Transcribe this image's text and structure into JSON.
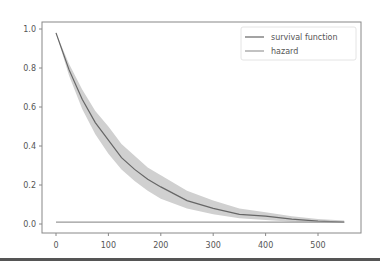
{
  "chart_data": {
    "type": "line",
    "title": "",
    "xlabel": "",
    "ylabel": "",
    "xlim": [
      -27,
      580
    ],
    "ylim": [
      -0.04,
      1.02
    ],
    "grid": false,
    "legend_position": "upper right",
    "xticks": [
      0,
      100,
      200,
      300,
      400,
      500
    ],
    "xtick_labels": [
      "0",
      "100",
      "200",
      "300",
      "400",
      "500"
    ],
    "yticks": [
      0.0,
      0.2,
      0.4,
      0.6,
      0.8,
      1.0
    ],
    "ytick_labels": [
      "0.0",
      "0.2",
      "0.4",
      "0.6",
      "0.8",
      "1.0"
    ],
    "series": [
      {
        "name": "survival function",
        "color": "#666666",
        "x": [
          0,
          25,
          50,
          75,
          100,
          125,
          150,
          175,
          200,
          250,
          300,
          350,
          400,
          450,
          500,
          550
        ],
        "y": [
          0.98,
          0.79,
          0.64,
          0.52,
          0.43,
          0.34,
          0.28,
          0.23,
          0.19,
          0.12,
          0.08,
          0.05,
          0.04,
          0.025,
          0.015,
          0.01
        ],
        "ci_lower": [
          0.98,
          0.76,
          0.59,
          0.46,
          0.36,
          0.28,
          0.22,
          0.17,
          0.13,
          0.08,
          0.05,
          0.03,
          0.02,
          0.012,
          0.008,
          0.005
        ],
        "ci_upper": [
          0.98,
          0.82,
          0.69,
          0.58,
          0.5,
          0.41,
          0.35,
          0.29,
          0.25,
          0.17,
          0.12,
          0.08,
          0.06,
          0.04,
          0.025,
          0.018
        ]
      },
      {
        "name": "hazard",
        "color": "#999999",
        "x": [
          0,
          550
        ],
        "y": [
          0.01,
          0.01
        ]
      }
    ]
  },
  "legend": {
    "items": [
      {
        "label": "survival function",
        "color": "#666666"
      },
      {
        "label": "hazard",
        "color": "#999999"
      }
    ]
  },
  "colors": {
    "ci_band": "#d0d0d0",
    "axis": "#888888"
  }
}
